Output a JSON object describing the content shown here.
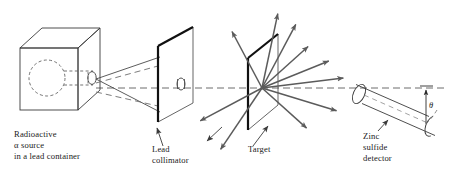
{
  "figure": {
    "domain_type": "diagram",
    "canvas": {
      "width": 458,
      "height": 180
    },
    "background_color": "#ffffff"
  },
  "colors": {
    "outline": "#3a3a3a",
    "heavy_edge": "#111111",
    "ray": "#5b5b5b",
    "beam": "#4a4a4a",
    "axis_dash": "#6d6d6d",
    "text": "#1a1a1a",
    "hidden_dash": "#5a5a5a"
  },
  "labels": {
    "source": {
      "name": "radioactive-source-label",
      "lines": [
        "Radioactive",
        "α source",
        "in a lead container"
      ],
      "x": 14,
      "y": 137
    },
    "collimator": {
      "name": "lead-collimator-label",
      "lines": [
        "Lead",
        "collimator"
      ],
      "x": 152,
      "y": 150
    },
    "target": {
      "name": "target-label",
      "lines": [
        "Target"
      ],
      "x": 248,
      "y": 150
    },
    "detector": {
      "name": "zinc-sulfide-detector-label",
      "lines": [
        "Zinc",
        "sulfide",
        "detector"
      ],
      "x": 363,
      "y": 137
    },
    "angle": {
      "name": "scattering-angle-label",
      "symbol": "θ",
      "x": 424,
      "y": 104
    }
  },
  "components": {
    "lead_container": {
      "name": "lead-container-box",
      "description": "cube drawn in oblique projection containing the alpha source cavity",
      "front_face": {
        "x": 20,
        "y": 48,
        "width": 58,
        "height": 62
      },
      "depth_dx": 22,
      "depth_dy": -20,
      "source_cavity": {
        "cx": 47,
        "cy": 78,
        "rx": 18,
        "ry": 18
      },
      "channel": {
        "x1": 63,
        "y1": 71,
        "x2": 92,
        "y2": 71,
        "x3": 63,
        "y3": 85,
        "x4": 92,
        "y4": 85
      },
      "aperture": {
        "cx": 93,
        "cy": 78,
        "rx": 4.5,
        "ry": 6
      }
    },
    "lead_collimator": {
      "name": "lead-collimator-plate",
      "description": "plate in perspective with central circular aperture",
      "near_edge": {
        "x1": 158,
        "y1": 122,
        "x2": 158,
        "y2": 46
      },
      "top_slant": {
        "x1": 158,
        "y1": 46,
        "x2": 193,
        "y2": 27
      },
      "far_edge": {
        "x1": 193,
        "y1": 27,
        "x2": 193,
        "y2": 103
      },
      "bottom_slant": {
        "x1": 193,
        "y1": 103,
        "x2": 158,
        "y2": 122
      },
      "hole": {
        "cx": 182,
        "cy": 84,
        "rx": 4,
        "ry": 6
      }
    },
    "target": {
      "name": "target-foil",
      "description": "thin metal foil with scattering point on its surface",
      "near_edge": {
        "x1": 248,
        "y1": 130,
        "x2": 248,
        "y2": 58
      },
      "top_slant": {
        "x1": 248,
        "y1": 58,
        "x2": 278,
        "y2": 34
      },
      "far_edge": {
        "x1": 278,
        "y1": 34,
        "x2": 278,
        "y2": 105
      },
      "bottom_slant": {
        "x1": 278,
        "y1": 105,
        "x2": 248,
        "y2": 130
      },
      "scatter_point": {
        "cx": 262,
        "cy": 88
      }
    },
    "zinc_sulfide_detector": {
      "name": "detector-cylinder",
      "description": "cylindrical scintillation detector tilted below the incident axis",
      "near_end": {
        "cx": 359,
        "cy": 94,
        "rx": 6,
        "ry": 10.5
      },
      "far_end": {
        "cx": 432,
        "cy": 126,
        "rx": 6,
        "ry": 10.5
      },
      "axis_angle_deg": 24
    },
    "axis": {
      "name": "incident-beam-axis",
      "description": "dashed horizontal line marking the undeviated beam direction",
      "y": 88,
      "x_start": 96,
      "x_end": 447
    },
    "angle_marker": {
      "name": "angle-indicator",
      "vertical_x": 426,
      "vertical_y_top": 88,
      "vertical_y_bottom": 124,
      "arc_from_deg": 0,
      "arc_to_deg": 24
    }
  },
  "beam": {
    "name": "collimated-alpha-beam",
    "description": "solid divergence lines from the source aperture to the collimator",
    "origin": {
      "x": 96,
      "y": 78
    },
    "upper": {
      "x": 160,
      "y": 58
    },
    "lower": {
      "x": 160,
      "y": 112
    }
  },
  "scattered_rays": {
    "name": "scattered-alpha-rays",
    "origin": {
      "x": 262,
      "y": 88
    },
    "count": 10,
    "rays": [
      {
        "id": "ray-back-up-left",
        "angle_deg": 118,
        "length": 64,
        "arrow": true
      },
      {
        "id": "ray-up-steep",
        "angle_deg": 78,
        "length": 76,
        "arrow": true
      },
      {
        "id": "ray-up-right-1",
        "angle_deg": 62,
        "length": 72,
        "arrow": true
      },
      {
        "id": "ray-up-right-2",
        "angle_deg": 42,
        "length": 62,
        "arrow": true
      },
      {
        "id": "ray-up-right-3",
        "angle_deg": 22,
        "length": 72,
        "arrow": true
      },
      {
        "id": "ray-forward",
        "angle_deg": 7,
        "length": 82,
        "arrow": true
      },
      {
        "id": "ray-down-right-1",
        "angle_deg": -17,
        "length": 78,
        "arrow": true
      },
      {
        "id": "ray-down-right-2",
        "angle_deg": -42,
        "length": 60,
        "arrow": true
      },
      {
        "id": "ray-down-left-1",
        "angle_deg": -124,
        "length": 74,
        "arrow": true
      },
      {
        "id": "ray-down-left-2",
        "angle_deg": -152,
        "length": 70,
        "arrow": true
      }
    ]
  }
}
